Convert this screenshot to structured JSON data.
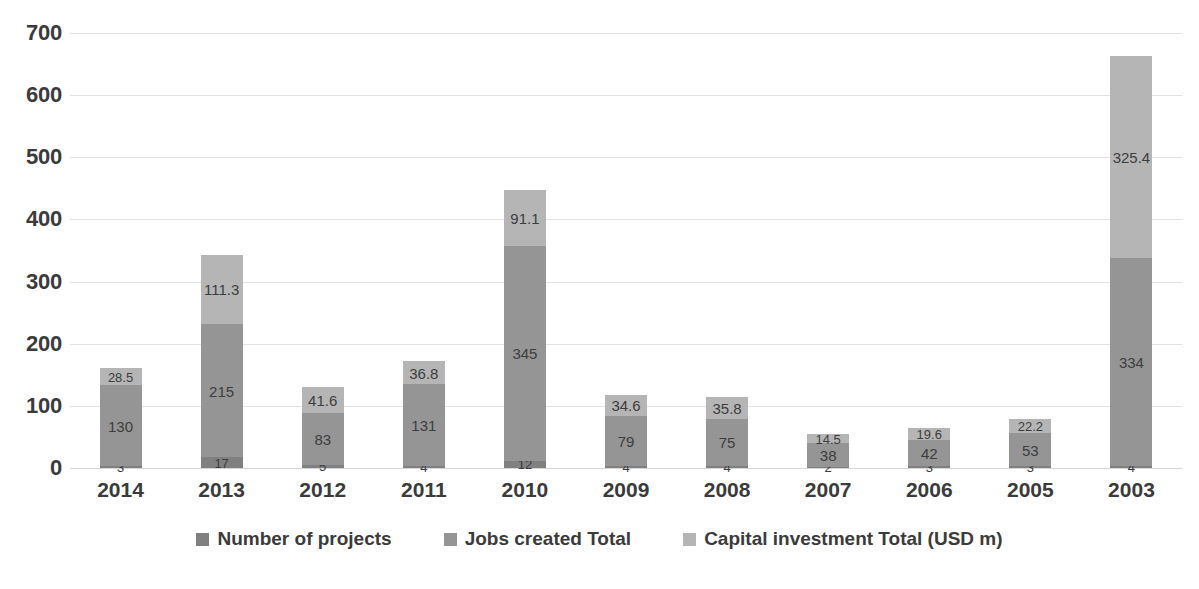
{
  "chart_data": {
    "type": "bar",
    "subtype": "stacked-vertical",
    "title": "",
    "subtitle": "",
    "xlabel": "",
    "ylabel": "",
    "ylim": [
      0,
      700
    ],
    "ytick_step": 100,
    "ytick_labels": [
      "700",
      "600",
      "500",
      "400",
      "300",
      "200",
      "100",
      "0"
    ],
    "ytick_values": [
      700,
      600,
      500,
      400,
      300,
      200,
      100,
      0
    ],
    "grid": true,
    "grid_axis": "y",
    "legend_position": "bottom",
    "categories": [
      "2014",
      "2013",
      "2012",
      "2011",
      "2010",
      "2009",
      "2008",
      "2007",
      "2006",
      "2005",
      "2003"
    ],
    "series": [
      {
        "name": "Number of projects",
        "color": "#808080",
        "values": [
          3,
          17,
          5,
          4,
          12,
          4,
          4,
          2,
          3,
          3,
          4
        ],
        "labels": [
          "3",
          "17",
          "5",
          "4",
          "12",
          "4",
          "4",
          "2",
          "3",
          "3",
          "4"
        ]
      },
      {
        "name": "Jobs created Total",
        "color": "#959595",
        "values": [
          130,
          215,
          83,
          131,
          345,
          79,
          75,
          38,
          42,
          53,
          334
        ],
        "labels": [
          "130",
          "215",
          "83",
          "131",
          "345",
          "79",
          "75",
          "38",
          "42",
          "53",
          "334"
        ]
      },
      {
        "name": "Capital investment  Total (USD m)",
        "color": "#b5b5b5",
        "values": [
          28.5,
          111.3,
          41.6,
          36.8,
          91.1,
          34.6,
          35.8,
          14.5,
          19.6,
          22.2,
          325.4
        ],
        "labels": [
          "28.5",
          "111.3",
          "41.6",
          "36.8",
          "91.1",
          "34.6",
          "35.8",
          "14.5",
          "19.6",
          "22.2",
          "325.4"
        ]
      }
    ],
    "totals": [
      161.5,
      343.3,
      129.6,
      171.8,
      448.1,
      117.6,
      114.8,
      54.5,
      64.6,
      78.2,
      663.4
    ]
  },
  "legend": {
    "items": [
      {
        "label": "Number of projects",
        "color": "#808080"
      },
      {
        "label": "Jobs created Total",
        "color": "#959595"
      },
      {
        "label": "Capital investment  Total (USD m)",
        "color": "#b5b5b5"
      }
    ]
  },
  "colors": {
    "background": "#ffffff",
    "gridline": "#e2e2e2",
    "axis_text": "#3b3b3b",
    "data_label": "#3d3d3d"
  }
}
